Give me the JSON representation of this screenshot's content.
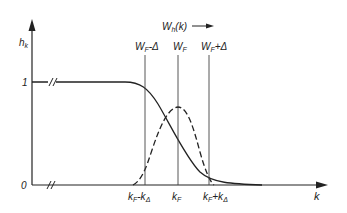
{
  "diagram": {
    "y_axis_label": "h_k",
    "x_axis_label": "k",
    "y_ticks": [
      "1",
      "0"
    ],
    "top_annotation": "W_h(k)",
    "vertical_lines": [
      {
        "label": "W_F - Δ",
        "x": 145
      },
      {
        "label": "W_F",
        "x": 178
      },
      {
        "label": "W_F + Δ",
        "x": 209
      }
    ],
    "x_ticks": [
      "k_F - k_Δ",
      "k_F",
      "k_F + k_Δ"
    ],
    "curves": [
      {
        "name": "step-function",
        "style": "solid",
        "description": "h_k = 1 for small k, smoothly decreasing to 0 around k_F"
      },
      {
        "name": "window-function",
        "style": "dashed",
        "description": "bell-shaped peak centered at k_F, between k_F - k_Δ and k_F + k_Δ"
      }
    ],
    "axis_break_marks": [
      "y=1 line",
      "x axis"
    ],
    "colors": {
      "ink": "#222222",
      "background": "#ffffff"
    }
  }
}
